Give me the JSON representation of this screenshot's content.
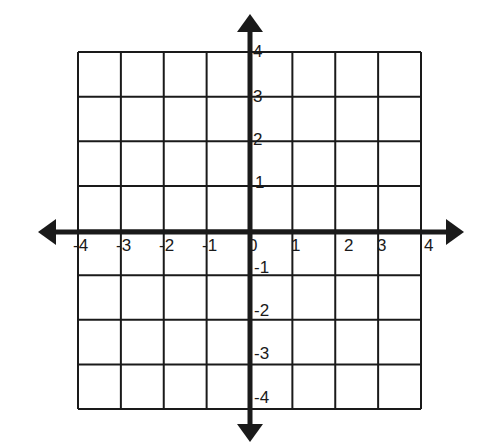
{
  "diagram": {
    "type": "coordinate-plane",
    "grid": {
      "cols": 8,
      "rows": 8,
      "left": 78,
      "top": 52,
      "right": 421,
      "bottom": 409
    },
    "colors": {
      "ink": "#1a1a1a",
      "background": "#ffffff"
    },
    "x_axis": {
      "ticks": [
        {
          "value": -4,
          "label": "-4"
        },
        {
          "value": -3,
          "label": "-3"
        },
        {
          "value": -2,
          "label": "-2"
        },
        {
          "value": -1,
          "label": "-1"
        },
        {
          "value": 0,
          "label": "0"
        },
        {
          "value": 1,
          "label": "1"
        },
        {
          "value": 2,
          "label": "2"
        },
        {
          "value": 3,
          "label": "3"
        },
        {
          "value": 4,
          "label": "4"
        }
      ]
    },
    "y_axis": {
      "ticks": [
        {
          "value": 4,
          "label": "4"
        },
        {
          "value": 3,
          "label": "3"
        },
        {
          "value": 2,
          "label": "2"
        },
        {
          "value": 1,
          "label": "1"
        },
        {
          "value": -1,
          "label": "-1"
        },
        {
          "value": -2,
          "label": "-2"
        },
        {
          "value": -3,
          "label": "-3"
        },
        {
          "value": -4,
          "label": "-4"
        }
      ]
    }
  }
}
